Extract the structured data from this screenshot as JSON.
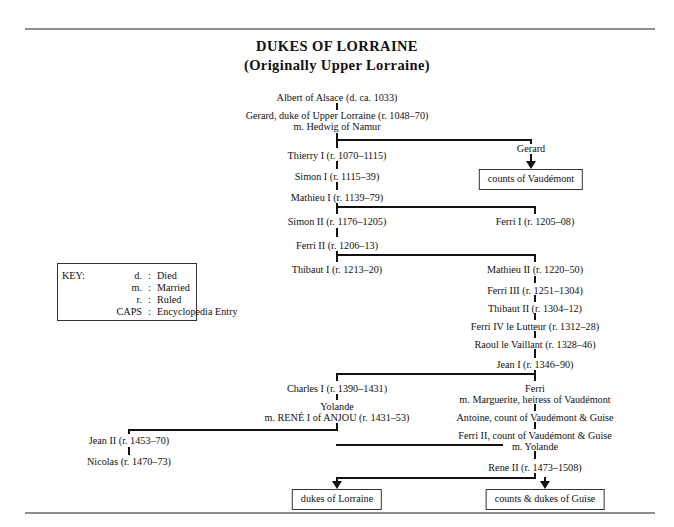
{
  "title": {
    "line1": "DUKES OF LORRAINE",
    "line2": "(Originally Upper Lorraine)"
  },
  "key": {
    "label": "KEY:",
    "rows": [
      {
        "abbr": "d.",
        "sep": ":",
        "meaning": "Died"
      },
      {
        "abbr": "m.",
        "sep": ":",
        "meaning": "Married"
      },
      {
        "abbr": "r.",
        "sep": ":",
        "meaning": "Ruled"
      },
      {
        "abbr": "CAPS",
        "sep": ":",
        "meaning": "Encyclopedia Entry"
      }
    ]
  },
  "nodes": {
    "albert": "Albert of Alsace (d. ca. 1033)",
    "gerard_duke": "Gerard, duke of Upper Lorraine (r. 1048–70)",
    "gerard_duke_m": "m. Hedwig of Namur",
    "thierry1": "Thierry I (r. 1070–1115)",
    "simon1": "Simon I (r. 1115–39)",
    "mathieu1": "Mathieu I (r. 1139–79)",
    "simon2": "Simon II (r. 1176–1205)",
    "ferri2": "Ferri II (r. 1206–13)",
    "thibaut1": "Thibaut I (r. 1213–20)",
    "gerard": "Gerard",
    "ferri1": "Ferri I (r. 1205–08)",
    "mathieu2": "Mathieu II (r. 1220–50)",
    "ferri3": "Ferri III (r. 1251–1304)",
    "thibaut2": "Thibaut II (r. 1304–12)",
    "ferri4": "Ferri IV le Lutteur (r. 1312–28)",
    "raoul": "Raoul le Vaillant (r. 1328–46)",
    "jean1": "Jean I (r. 1346–90)",
    "charles1": "Charles I (r. 1390–1431)",
    "yolande": "Yolande",
    "yolande_m": "m. RENÉ I of ANJOU (r. 1431–53)",
    "jean2": "Jean II (r. 1453–70)",
    "nicolas": "Nicolas (r. 1470–73)",
    "ferri_vaud": "Ferri",
    "ferri_vaud_m": "m. Marguerite, heiress of Vaudémont",
    "antoine": "Antoine, count of Vaudémont & Guise",
    "ferri2_vaud": "Ferri II, count of Vaudémont & Guise",
    "ferri2_vaud_m": "m. Yolande",
    "rene2": "Rene II (r. 1473–1508)"
  },
  "boxes": {
    "counts_vaudemont": "counts of Vaudémont",
    "dukes_lorraine": "dukes of Lorraine",
    "counts_dukes_guise": "counts & dukes of Guise"
  },
  "colors": {
    "rule": "#8d8d93",
    "line": "#111111",
    "text": "#111111",
    "background": "#ffffff"
  }
}
